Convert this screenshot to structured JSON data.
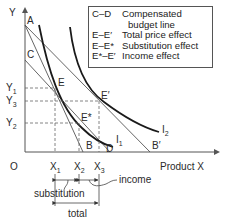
{
  "diagram": {
    "type": "indifference-curve-price-effect",
    "axes": {
      "y_label": "Y",
      "x_label": "Product X",
      "origin_label": "O"
    },
    "y_ticks": [
      {
        "label": "Y",
        "sub": "1"
      },
      {
        "label": "Y",
        "sub": "3"
      },
      {
        "label": "Y",
        "sub": "2"
      }
    ],
    "x_ticks": [
      {
        "label": "X",
        "sub": "1"
      },
      {
        "label": "X",
        "sub": "2"
      },
      {
        "label": "X",
        "sub": "3"
      }
    ],
    "points": {
      "A": "A",
      "C": "C",
      "B": "B",
      "D": "D",
      "B_prime": "B′",
      "E": "E",
      "E_prime": "E′",
      "E_star": "E*"
    },
    "curves": {
      "I1": {
        "label": "I",
        "sub": "1"
      },
      "I2": {
        "label": "I",
        "sub": "2"
      }
    },
    "legend": [
      {
        "key": "C–D",
        "value": "Compensated",
        "cont": "budget line"
      },
      {
        "key": "E–E′",
        "value": "Total price effect"
      },
      {
        "key": "E–E*",
        "value": "Substitution effect"
      },
      {
        "key": "E*–E′",
        "value": "Income effect"
      }
    ],
    "annotations": {
      "substitution": "substitution",
      "income": "income",
      "total": "total"
    },
    "colors": {
      "curve": "#1a1a1a",
      "line": "#555555",
      "dashed": "#666666"
    }
  }
}
